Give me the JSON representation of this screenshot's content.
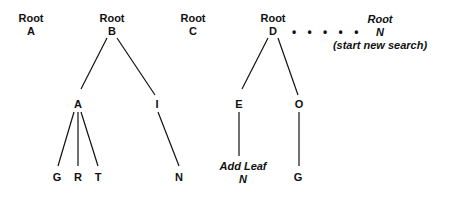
{
  "roots": [
    {
      "line1": "Root",
      "line2": "A"
    },
    {
      "line1": "Root",
      "line2": "B"
    },
    {
      "line1": "Root",
      "line2": "C"
    },
    {
      "line1": "Root",
      "line2": "D"
    },
    {
      "line1": "Root",
      "line2": "N",
      "line3": "(start new search)"
    }
  ],
  "connector": "• • • • •",
  "tree_b": {
    "children": [
      "A",
      "I"
    ],
    "a_children": [
      "G",
      "R",
      "T"
    ],
    "i_children": [
      "N"
    ]
  },
  "tree_d": {
    "children": [
      "E",
      "O"
    ],
    "e_child": {
      "line1": "Add Leaf",
      "line2": "N"
    },
    "o_children": [
      "G"
    ]
  }
}
